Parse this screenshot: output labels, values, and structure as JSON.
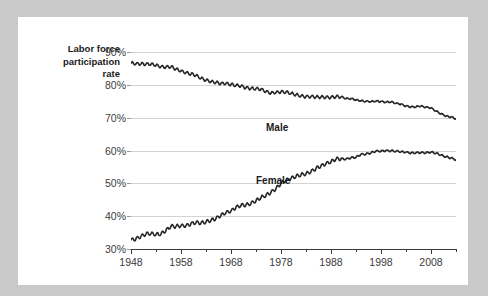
{
  "figure": {
    "axis_title_lines": [
      "Labor force",
      "participation",
      "rate"
    ],
    "series_labels": {
      "male": "Male",
      "female": "Female"
    },
    "colors": {
      "line": "#262626",
      "grid": "#d3d3d3",
      "axis": "#3b3b3b",
      "card": "#ffffff",
      "page": "#c9c9c9"
    }
  },
  "chart_data": {
    "type": "line",
    "title": "",
    "xlabel": "",
    "ylabel": "Labor force participation rate",
    "xlim": [
      1948,
      2013
    ],
    "ylim": [
      30,
      90
    ],
    "grid": true,
    "legend": "inline-labels",
    "xticks": [
      1948,
      1958,
      1968,
      1978,
      1988,
      1998,
      2008
    ],
    "xticks_minor": [
      1953,
      1963,
      1973,
      1983,
      1993,
      2003,
      2013
    ],
    "yticks": [
      30,
      40,
      50,
      60,
      70,
      80,
      90
    ],
    "ytick_labels": [
      "30%",
      "40%",
      "50%",
      "60%",
      "70%",
      "80%",
      "90%"
    ],
    "x": [
      1948,
      1949,
      1950,
      1951,
      1952,
      1953,
      1954,
      1955,
      1956,
      1957,
      1958,
      1959,
      1960,
      1961,
      1962,
      1963,
      1964,
      1965,
      1966,
      1967,
      1968,
      1969,
      1970,
      1971,
      1972,
      1973,
      1974,
      1975,
      1976,
      1977,
      1978,
      1979,
      1980,
      1981,
      1982,
      1983,
      1984,
      1985,
      1986,
      1987,
      1988,
      1989,
      1990,
      1991,
      1992,
      1993,
      1994,
      1995,
      1996,
      1997,
      1998,
      1999,
      2000,
      2001,
      2002,
      2003,
      2004,
      2005,
      2006,
      2007,
      2008,
      2009,
      2010,
      2011,
      2012,
      2013
    ],
    "series": [
      {
        "name": "Male",
        "values": [
          86.6,
          86.4,
          86.4,
          86.3,
          86.3,
          86.0,
          85.5,
          85.4,
          85.5,
          84.8,
          84.2,
          83.7,
          83.3,
          82.9,
          82.0,
          81.4,
          81.0,
          80.7,
          80.4,
          80.4,
          80.1,
          79.8,
          79.7,
          79.1,
          78.9,
          78.8,
          78.7,
          77.9,
          77.5,
          77.7,
          77.9,
          77.8,
          77.4,
          77.0,
          76.6,
          76.4,
          76.4,
          76.3,
          76.3,
          76.2,
          76.2,
          76.4,
          76.4,
          75.8,
          75.8,
          75.4,
          75.1,
          75.0,
          74.9,
          75.0,
          74.9,
          74.7,
          74.8,
          74.4,
          74.1,
          73.5,
          73.3,
          73.3,
          73.5,
          73.2,
          73.0,
          72.0,
          71.2,
          70.5,
          70.2,
          69.7
        ]
      },
      {
        "name": "Female",
        "values": [
          32.7,
          33.1,
          33.9,
          34.6,
          34.7,
          34.4,
          34.6,
          35.7,
          36.9,
          36.9,
          37.1,
          37.1,
          37.7,
          38.1,
          37.9,
          38.3,
          38.7,
          39.3,
          40.3,
          41.1,
          41.6,
          42.7,
          43.3,
          43.4,
          43.9,
          44.7,
          45.7,
          46.3,
          47.3,
          48.4,
          50.0,
          50.9,
          51.5,
          52.1,
          52.6,
          52.9,
          53.6,
          54.5,
          55.3,
          56.0,
          56.6,
          57.4,
          57.5,
          57.4,
          57.8,
          57.9,
          58.8,
          58.9,
          59.3,
          59.8,
          59.8,
          60.0,
          59.9,
          59.8,
          59.6,
          59.5,
          59.2,
          59.3,
          59.4,
          59.3,
          59.5,
          59.2,
          58.6,
          58.1,
          57.7,
          57.2
        ]
      }
    ]
  }
}
